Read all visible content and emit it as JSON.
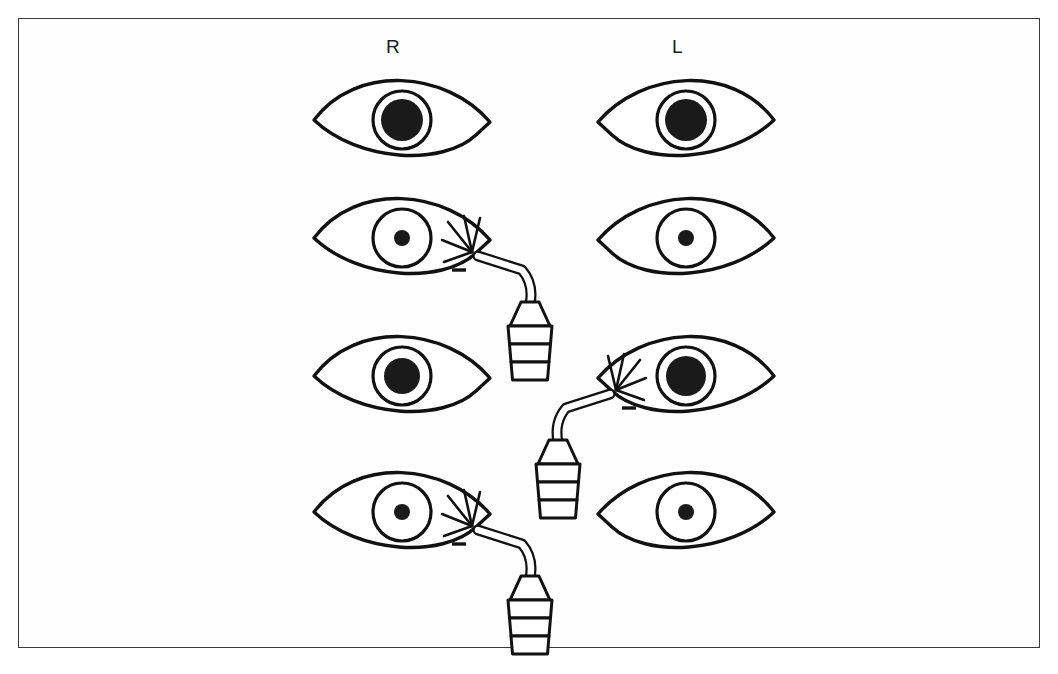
{
  "figure": {
    "border_color": "#3a3a3a",
    "background_color": "#ffffff",
    "ink_color": "#111111",
    "pupil_color": "#1a1a1a"
  },
  "column_labels": [
    {
      "key": "right",
      "text": "R",
      "x": 386,
      "y": 36
    },
    {
      "key": "left",
      "text": "L",
      "x": 672,
      "y": 36
    }
  ],
  "geometry": {
    "eye_half_width": 88,
    "eye_half_height": 38,
    "iris_radius": 29,
    "right_eye_center_x": 402,
    "left_eye_center_x": 686,
    "row_center_y": [
      120,
      238,
      376,
      512
    ]
  },
  "rows": [
    {
      "index": 1,
      "name": "baseline-both-dilated",
      "center_y": 120,
      "eyes": [
        {
          "side": "right",
          "name": "eye-r-row1",
          "center_x": 402,
          "pupil_radius": 21,
          "pupil_state": "dilated",
          "illuminated": false,
          "light": null
        },
        {
          "side": "left",
          "name": "eye-l-row1",
          "center_x": 686,
          "pupil_radius": 21,
          "pupil_state": "dilated",
          "illuminated": false,
          "light": null
        }
      ]
    },
    {
      "index": 2,
      "name": "light-right-both-constrict",
      "center_y": 238,
      "eyes": [
        {
          "side": "right",
          "name": "eye-r-row2",
          "center_x": 402,
          "pupil_radius": 8,
          "pupil_state": "constricted",
          "illuminated": true,
          "light": {
            "name": "penlight-row2-right",
            "orientation": "right",
            "tip_x": 478,
            "tip_y": 256,
            "label": "penlight"
          }
        },
        {
          "side": "left",
          "name": "eye-l-row2",
          "center_x": 686,
          "pupil_radius": 8,
          "pupil_state": "constricted",
          "illuminated": false,
          "light": null
        }
      ]
    },
    {
      "index": 3,
      "name": "baseline-before-left-stimulus",
      "center_y": 376,
      "eyes": [
        {
          "side": "right",
          "name": "eye-r-row3",
          "center_x": 402,
          "pupil_radius": 18,
          "pupil_state": "dilated",
          "illuminated": false,
          "light": null
        },
        {
          "side": "left",
          "name": "eye-l-row3",
          "center_x": 686,
          "pupil_radius": 20,
          "pupil_state": "dilated",
          "illuminated": true,
          "light": {
            "name": "penlight-row3-left",
            "orientation": "left",
            "tip_x": 610,
            "tip_y": 394,
            "label": "penlight"
          }
        }
      ]
    },
    {
      "index": 4,
      "name": "light-right-both-constrict-repeat",
      "center_y": 512,
      "eyes": [
        {
          "side": "right",
          "name": "eye-r-row4",
          "center_x": 402,
          "pupil_radius": 8,
          "pupil_state": "constricted",
          "illuminated": true,
          "light": {
            "name": "penlight-row4-right",
            "orientation": "right",
            "tip_x": 478,
            "tip_y": 530,
            "label": "penlight"
          }
        },
        {
          "side": "left",
          "name": "eye-l-row4",
          "center_x": 686,
          "pupil_radius": 8,
          "pupil_state": "constricted",
          "illuminated": false,
          "light": null
        }
      ]
    }
  ],
  "icons": {
    "eye": "eye-icon",
    "pupil": "pupil-icon",
    "iris": "iris-icon",
    "penlight": "penlight-icon",
    "light_rays": "light-rays-icon"
  }
}
